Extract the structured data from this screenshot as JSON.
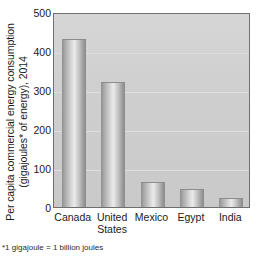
{
  "chart_data": {
    "type": "bar",
    "title": "",
    "subtitle": "",
    "xlabel": "",
    "ylabel_lines": [
      "Per capita commercial energy consumption",
      "(gigajoules* of energy), 2014"
    ],
    "ylabel": "Per capita commercial energy consumption (gigajoules* of energy), 2014",
    "categories": [
      "Canada",
      "United States",
      "Mexico",
      "Egypt",
      "India"
    ],
    "category_lines": [
      [
        "Canada"
      ],
      [
        "United",
        "States"
      ],
      [
        "Mexico"
      ],
      [
        "Egypt"
      ],
      [
        "India"
      ]
    ],
    "values": [
      430,
      320,
      65,
      45,
      23
    ],
    "ylim": [
      0,
      500
    ],
    "yticks": [
      500,
      400,
      300,
      200,
      100,
      0
    ],
    "ytick_labels": [
      "500",
      "400",
      "300",
      "200",
      "100",
      "0"
    ],
    "grid": true,
    "legend": false,
    "legend_position": "none",
    "footnote": "*1 gigajoule = 1 billion joules",
    "colors": {
      "bar_light": "#eaeaea",
      "bar_mid": "#c2c2c2",
      "bar_dark": "#8a8a8a",
      "plot_background": "#d2d2d2",
      "gridline": "#dedede",
      "frame": "#6f6f6f",
      "text": "#1a1a1a"
    }
  }
}
